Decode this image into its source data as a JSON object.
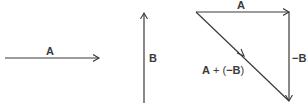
{
  "diagram": {
    "colors": {
      "stroke": "#3a3a3a",
      "background": "#ffffff"
    },
    "vectors": {
      "A": {
        "label": "A"
      },
      "B": {
        "label": "B"
      },
      "triangle_A": {
        "label": "A"
      },
      "neg_B": {
        "label": "−B"
      },
      "resultant": {
        "label_A": "A",
        "label_plus": " + (",
        "label_negB": "−B",
        "label_close": ")"
      }
    }
  }
}
